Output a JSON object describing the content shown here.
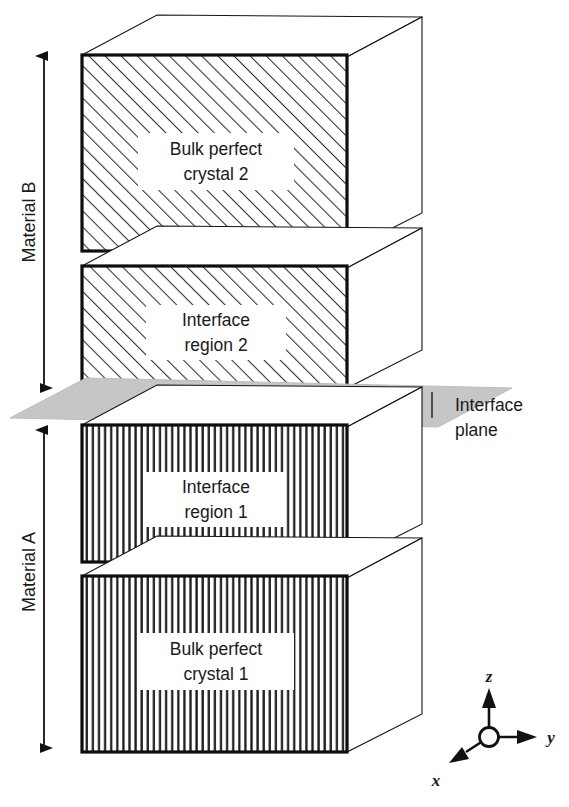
{
  "figure": {
    "blocks": [
      {
        "id": "bulk-perfect-crystal-2",
        "label_line1": "Bulk perfect",
        "label_line2": "crystal 2",
        "material": "B",
        "hatch": "diagonal",
        "front": {
          "x": 82,
          "y": 55,
          "w": 265,
          "h": 196
        },
        "depth": {
          "dx": 75,
          "dy": -40
        }
      },
      {
        "id": "interface-region-2",
        "label_line1": "Interface",
        "label_line2": "region 2",
        "material": "B",
        "hatch": "diagonal",
        "front": {
          "x": 82,
          "y": 266,
          "w": 265,
          "h": 122
        },
        "depth": {
          "dx": 75,
          "dy": -40
        }
      },
      {
        "id": "interface-region-1",
        "label_line1": "Interface",
        "label_line2": "region 1",
        "material": "A",
        "hatch": "vertical",
        "front": {
          "x": 82,
          "y": 425,
          "w": 265,
          "h": 137
        },
        "depth": {
          "dx": 75,
          "dy": -40
        }
      },
      {
        "id": "bulk-perfect-crystal-1",
        "label_line1": "Bulk perfect",
        "label_line2": "crystal 1",
        "material": "A",
        "hatch": "vertical",
        "front": {
          "x": 82,
          "y": 576,
          "w": 265,
          "h": 176
        },
        "depth": {
          "dx": 75,
          "dy": -40
        }
      }
    ],
    "material_brackets": [
      {
        "id": "material-b",
        "label": "Material B",
        "y_top": 52,
        "y_bottom": 392,
        "x": 44
      },
      {
        "id": "material-a",
        "label": "Material A",
        "y_top": 428,
        "y_bottom": 750,
        "x": 44
      }
    ],
    "interface_plane": {
      "label_line1": "Interface",
      "label_line2": "plane",
      "color": "#c3c3c3",
      "label_x": 455,
      "label_y1": 404,
      "label_y2": 428
    },
    "axes": {
      "origin": {
        "x": 489,
        "y": 737
      },
      "z": {
        "label": "z"
      },
      "y": {
        "label": "y"
      },
      "x": {
        "label": "x"
      }
    },
    "colors": {
      "stroke": "#111111",
      "hatch": "#3a3a3a",
      "plane": "#c6c6c6",
      "background": "#ffffff"
    }
  }
}
